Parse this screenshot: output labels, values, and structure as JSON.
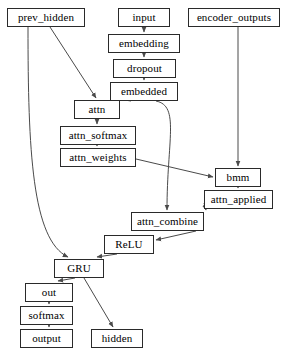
{
  "diagram": {
    "type": "directed-graph",
    "canvas": {
      "width": 285,
      "height": 356,
      "background": "#ffffff"
    },
    "style": {
      "node_border": "#2a2a2a",
      "node_fill": "#ffffff",
      "edge_color": "#4a4a4a",
      "text_color": "#000000"
    },
    "nodes": [
      {
        "id": "prev_hidden",
        "label": "prev_hidden",
        "x": 7,
        "y": 8,
        "w": 78,
        "h": 19
      },
      {
        "id": "input",
        "label": "input",
        "x": 118,
        "y": 8,
        "w": 52,
        "h": 19
      },
      {
        "id": "encoder_outputs",
        "label": "encoder_outputs",
        "x": 188,
        "y": 8,
        "w": 92,
        "h": 19
      },
      {
        "id": "embedding",
        "label": "embedding",
        "x": 108,
        "y": 34,
        "w": 72,
        "h": 19
      },
      {
        "id": "dropout",
        "label": "dropout",
        "x": 113,
        "y": 59,
        "w": 63,
        "h": 19
      },
      {
        "id": "embedded",
        "label": "embedded",
        "x": 110,
        "y": 82,
        "w": 68,
        "h": 19
      },
      {
        "id": "attn",
        "label": "attn",
        "x": 74,
        "y": 100,
        "w": 46,
        "h": 19
      },
      {
        "id": "attn_softmax",
        "label": "attn_softmax",
        "x": 60,
        "y": 126,
        "w": 76,
        "h": 19
      },
      {
        "id": "attn_weights",
        "label": "attn_weights",
        "x": 60,
        "y": 148,
        "w": 76,
        "h": 19
      },
      {
        "id": "bmm",
        "label": "bmm",
        "x": 215,
        "y": 168,
        "w": 46,
        "h": 19
      },
      {
        "id": "attn_applied",
        "label": "attn_applied",
        "x": 204,
        "y": 190,
        "w": 69,
        "h": 19
      },
      {
        "id": "attn_combine",
        "label": "attn_combine",
        "x": 131,
        "y": 212,
        "w": 73,
        "h": 19
      },
      {
        "id": "ReLU",
        "label": "ReLU",
        "x": 104,
        "y": 235,
        "w": 50,
        "h": 19
      },
      {
        "id": "GRU",
        "label": "GRU",
        "x": 54,
        "y": 259,
        "w": 50,
        "h": 19
      },
      {
        "id": "out",
        "label": "out",
        "x": 25,
        "y": 283,
        "w": 48,
        "h": 19
      },
      {
        "id": "softmax",
        "label": "softmax",
        "x": 20,
        "y": 306,
        "w": 53,
        "h": 19
      },
      {
        "id": "output",
        "label": "output",
        "x": 20,
        "y": 329,
        "w": 53,
        "h": 19
      },
      {
        "id": "hidden",
        "label": "hidden",
        "x": 91,
        "y": 329,
        "w": 52,
        "h": 19
      }
    ],
    "edges": [
      {
        "from": "input",
        "to": "embedding",
        "path": "M 144,27 L 144,32",
        "kind": "straight"
      },
      {
        "from": "embedding",
        "to": "dropout",
        "path": "M 144,53 L 144,57",
        "kind": "straight"
      },
      {
        "from": "dropout",
        "to": "embedded",
        "path": "M 144,78 L 144,80",
        "kind": "straight"
      },
      {
        "from": "embedded",
        "to": "attn",
        "path": "M 131,101 L 112,98",
        "kind": "diagonal"
      },
      {
        "from": "prev_hidden",
        "to": "attn",
        "path": "M 50,27 L 96,98",
        "kind": "diagonal"
      },
      {
        "from": "attn",
        "to": "attn_softmax",
        "path": "M 97,119 L 97,124",
        "kind": "straight"
      },
      {
        "from": "attn_softmax",
        "to": "attn_weights",
        "path": "M 97,145 L 97,146",
        "kind": "straight"
      },
      {
        "from": "attn_weights",
        "to": "bmm",
        "path": "M 136,159 L 213,177",
        "kind": "diagonal"
      },
      {
        "from": "encoder_outputs",
        "to": "bmm",
        "path": "M 238,27 L 238,166",
        "kind": "straight"
      },
      {
        "from": "bmm",
        "to": "attn_applied",
        "path": "M 238,187 L 238,188",
        "kind": "straight"
      },
      {
        "from": "attn_applied",
        "to": "attn_combine",
        "path": "M 204,203 L 206,210",
        "kind": "diagonal"
      },
      {
        "from": "embedded",
        "to": "attn_combine",
        "path": "M 156,101 C 180,106 167,140 167,210",
        "kind": "curve"
      },
      {
        "from": "attn_combine",
        "to": "ReLU",
        "path": "M 196,231 L 156,240",
        "kind": "diagonal"
      },
      {
        "from": "ReLU",
        "to": "GRU",
        "path": "M 117,254 L 97,257",
        "kind": "diagonal"
      },
      {
        "from": "prev_hidden",
        "to": "GRU",
        "path": "M 28,27 C 28,150 32,240 68,257",
        "kind": "curve"
      },
      {
        "from": "GRU",
        "to": "out",
        "path": "M 75,278 L 58,281",
        "kind": "diagonal"
      },
      {
        "from": "GRU",
        "to": "hidden",
        "path": "M 84,278 L 113,327",
        "kind": "diagonal"
      },
      {
        "from": "out",
        "to": "softmax",
        "path": "M 49,302 L 49,304",
        "kind": "straight"
      },
      {
        "from": "softmax",
        "to": "output",
        "path": "M 49,325 L 49,327",
        "kind": "straight"
      }
    ]
  }
}
